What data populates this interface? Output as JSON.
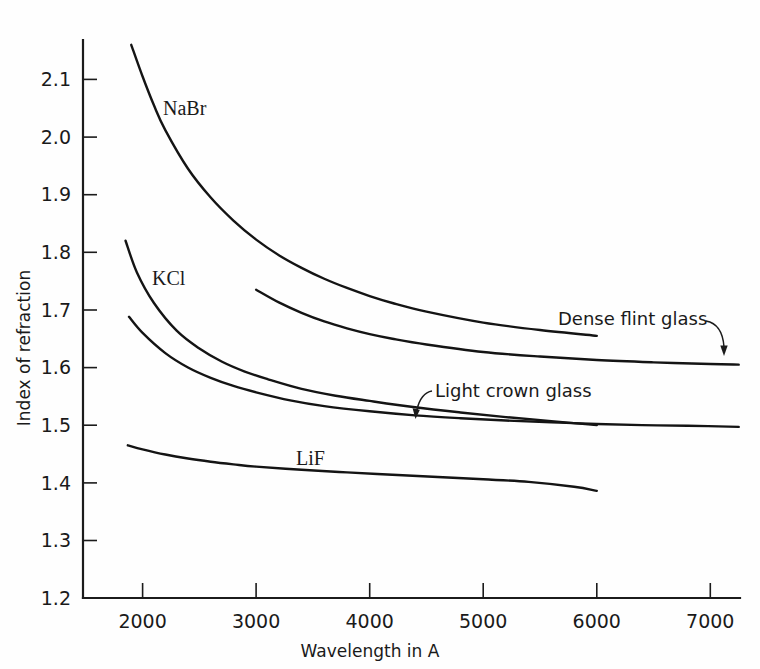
{
  "chart_data": {
    "type": "line",
    "title": "",
    "xlabel": "Wavelength in A",
    "ylabel": "Index of refraction",
    "xlim": [
      1550,
      7300
    ],
    "ylim": [
      1.2,
      2.19
    ],
    "grid": false,
    "legend_position": "inline-labels",
    "xticks": [
      "2000",
      "3000",
      "4000",
      "5000",
      "6000",
      "7000"
    ],
    "xtick_values": [
      2000,
      3000,
      4000,
      5000,
      6000,
      7000
    ],
    "yticks": [
      "1.2",
      "1.3",
      "1.4",
      "1.5",
      "1.6",
      "1.7",
      "1.8",
      "1.9",
      "2.0",
      "2.1"
    ],
    "ytick_values": [
      1.2,
      1.3,
      1.4,
      1.5,
      1.6,
      1.7,
      1.8,
      1.9,
      2.0,
      2.1
    ],
    "series": [
      {
        "name": "NaBr",
        "label_kind": "inline",
        "x": [
          1900,
          2000,
          2100,
          2200,
          2400,
          2600,
          2800,
          3000,
          3200,
          3400,
          3600,
          3800,
          4000,
          4200,
          4500,
          5000,
          5500,
          6000
        ],
        "y": [
          2.16,
          2.105,
          2.055,
          2.012,
          1.945,
          1.895,
          1.855,
          1.822,
          1.795,
          1.773,
          1.754,
          1.738,
          1.724,
          1.712,
          1.697,
          1.678,
          1.665,
          1.655
        ]
      },
      {
        "name": "Dense flint glass",
        "label_kind": "annotation",
        "x": [
          3000,
          3200,
          3400,
          3600,
          3800,
          4000,
          4200,
          4500,
          5000,
          5500,
          6000,
          6500,
          7000,
          7250
        ],
        "y": [
          1.735,
          1.713,
          1.695,
          1.68,
          1.668,
          1.658,
          1.65,
          1.64,
          1.627,
          1.619,
          1.613,
          1.609,
          1.606,
          1.605
        ]
      },
      {
        "name": "KCl",
        "label_kind": "inline",
        "x": [
          1850,
          1950,
          2100,
          2300,
          2500,
          2700,
          2900,
          3100,
          3400,
          3700,
          4000,
          4400,
          4800,
          5200,
          5600,
          6000
        ],
        "y": [
          1.82,
          1.765,
          1.712,
          1.664,
          1.633,
          1.61,
          1.593,
          1.58,
          1.563,
          1.551,
          1.542,
          1.531,
          1.522,
          1.514,
          1.507,
          1.5
        ]
      },
      {
        "name": "Light crown glass",
        "label_kind": "annotation",
        "x": [
          1880,
          2000,
          2200,
          2400,
          2600,
          2800,
          3000,
          3300,
          3600,
          4000,
          4400,
          4800,
          5200,
          5600,
          6000,
          6400,
          6800,
          7250
        ],
        "y": [
          1.688,
          1.66,
          1.625,
          1.6,
          1.582,
          1.568,
          1.557,
          1.543,
          1.533,
          1.524,
          1.517,
          1.512,
          1.508,
          1.505,
          1.502,
          1.5,
          1.499,
          1.497
        ]
      },
      {
        "name": "LiF",
        "label_kind": "inline",
        "x": [
          1870,
          2000,
          2200,
          2400,
          2600,
          2800,
          3000,
          3400,
          3800,
          4200,
          4600,
          5000,
          5400,
          5800,
          6000
        ],
        "y": [
          1.465,
          1.458,
          1.449,
          1.442,
          1.4365,
          1.432,
          1.428,
          1.4225,
          1.418,
          1.414,
          1.41,
          1.406,
          1.4015,
          1.393,
          1.386
        ]
      }
    ],
    "annotations": [
      {
        "text": "NaBr",
        "x": 2250,
        "y": 2.035
      },
      {
        "text": "KCl",
        "x": 2100,
        "y": 1.755
      },
      {
        "text": "LiF",
        "x": 3600,
        "y": 1.432
      },
      {
        "text": "Dense flint glass",
        "x": 5500,
        "y": 1.675
      },
      {
        "text": "Light crown glass",
        "x": 4400,
        "y": 1.545
      }
    ]
  },
  "axes": {
    "x_title": "Wavelength in A",
    "y_title": "Index of refraction",
    "x_tick_labels": [
      "2000",
      "3000",
      "4000",
      "5000",
      "6000",
      "7000"
    ],
    "y_tick_labels": [
      "2.1",
      "2.0",
      "1.9",
      "1.8",
      "1.7",
      "1.6",
      "1.5",
      "1.4",
      "1.3",
      "1.2"
    ]
  },
  "labels": {
    "nabr": "NaBr",
    "kcl": "KCl",
    "lif": "LiF",
    "dense_flint_glass": "Dense flint glass",
    "light_crown_glass": "Light crown glass"
  },
  "colors": {
    "ink": "#141414",
    "background": "#ffffff"
  }
}
